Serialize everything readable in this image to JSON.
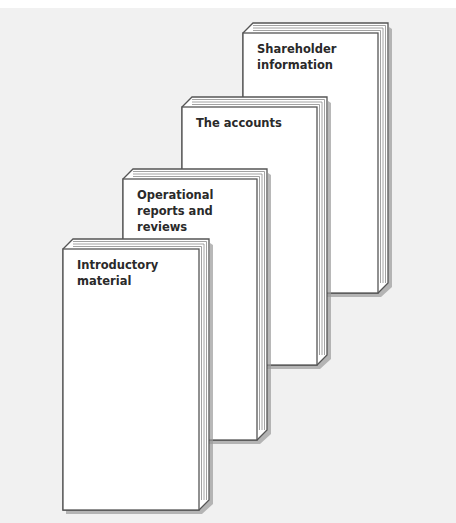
{
  "diagram": {
    "type": "stacked-document-sections",
    "books": [
      {
        "id": "introductory",
        "label": "Introductory material",
        "lines": "Introductory\nmaterial",
        "x": 63,
        "y": 249,
        "w": 136,
        "h": 261
      },
      {
        "id": "operational",
        "label": "Operational reports and reviews",
        "lines": "Operational\nreports and\nreviews",
        "x": 123,
        "y": 179,
        "w": 134,
        "h": 261
      },
      {
        "id": "accounts",
        "label": "The accounts",
        "lines": "The accounts",
        "x": 182,
        "y": 107,
        "w": 135,
        "h": 258
      },
      {
        "id": "shareholder",
        "label": "Shareholder information",
        "lines": "Shareholder\ninformation",
        "x": 243,
        "y": 33,
        "w": 135,
        "h": 260
      }
    ],
    "colors": {
      "background": "#f1f1f1",
      "page": "#ffffff",
      "edge": "#555555",
      "shadow": "#9a9a9a",
      "text": "#2a2a2a"
    }
  }
}
